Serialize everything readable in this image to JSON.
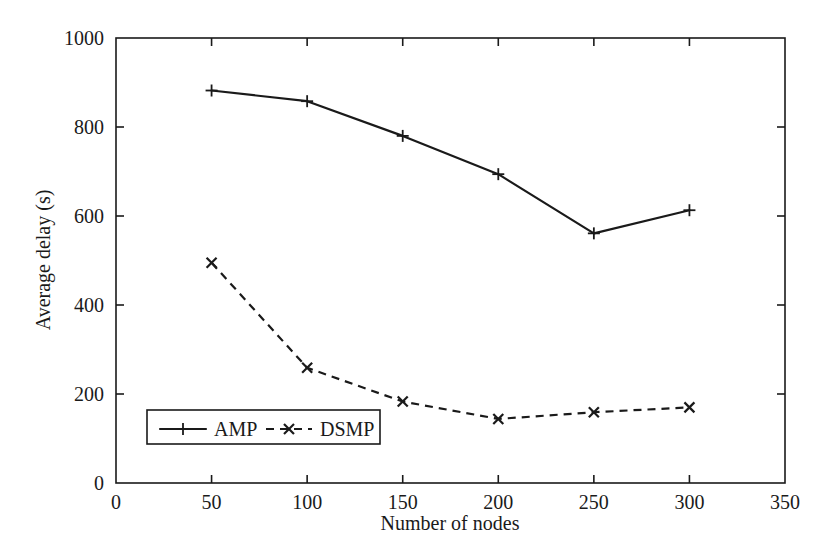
{
  "chart_data": {
    "type": "line",
    "title": "",
    "subtitle": "",
    "xlabel": "Number of nodes",
    "ylabel": "Average delay (s)",
    "xlim": [
      0,
      350
    ],
    "ylim": [
      0,
      1000
    ],
    "xticks": [
      0,
      50,
      100,
      150,
      200,
      250,
      300,
      350
    ],
    "xtick_labels": [
      "0",
      "50",
      "100",
      "150",
      "200",
      "250",
      "300",
      "350"
    ],
    "yticks": [
      0,
      200,
      400,
      600,
      800,
      1000
    ],
    "ytick_labels": [
      "0",
      "200",
      "400",
      "600",
      "800",
      "1000"
    ],
    "grid": false,
    "legend_position": "lower-left-inside",
    "x": [
      50,
      100,
      150,
      200,
      250,
      300
    ],
    "series": [
      {
        "name": "AMP",
        "values": [
          882,
          858,
          780,
          694,
          561,
          613
        ],
        "line_style": "solid",
        "marker": "plus",
        "color": "#1a1a1a"
      },
      {
        "name": "DSMP",
        "values": [
          495,
          259,
          183,
          144,
          159,
          170
        ],
        "line_style": "dashed",
        "marker": "cross",
        "color": "#1a1a1a"
      }
    ]
  },
  "legend": {
    "entries": [
      {
        "label": "AMP",
        "style": "solid",
        "marker": "plus"
      },
      {
        "label": "DSMP",
        "style": "dashed",
        "marker": "cross"
      }
    ]
  },
  "axes": {
    "y_axis_title": "Average delay (s)",
    "x_axis_title": "Number of nodes"
  }
}
